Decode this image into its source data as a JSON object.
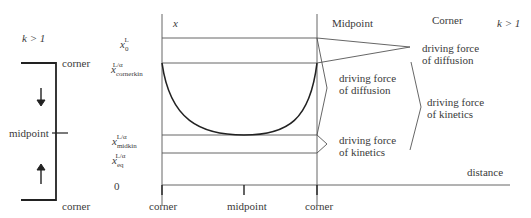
{
  "left_panel": {
    "condition": "k > 1",
    "top_label": "corner",
    "mid_label": "midpoint",
    "bottom_label": "corner"
  },
  "y_axis": {
    "labels": [
      {
        "var": "x",
        "sub": "0",
        "sup": "L"
      },
      {
        "var": "x",
        "sub": "cornerkin",
        "sup": "L/α"
      },
      {
        "var": "x",
        "sub": "midkin",
        "sup": "L/α"
      },
      {
        "var": "x",
        "sub": "eq",
        "sup": "L/α"
      },
      {
        "var": "0",
        "sub": "",
        "sup": ""
      }
    ],
    "axis_var": "x"
  },
  "x_axis": {
    "ticks": [
      "corner",
      "midpoint",
      "corner"
    ],
    "label": "distance"
  },
  "headers": {
    "midpoint": "Midpoint",
    "corner": "Corner",
    "condition": "k > 1"
  },
  "annotations": {
    "mid_diffusion": [
      "driving force",
      "of diffusion"
    ],
    "mid_kinetics": [
      "driving force",
      "of kinetics"
    ],
    "corner_diffusion": [
      "driving force",
      "of diffusion"
    ],
    "corner_kinetics": [
      "driving force",
      "of kinetics"
    ]
  }
}
